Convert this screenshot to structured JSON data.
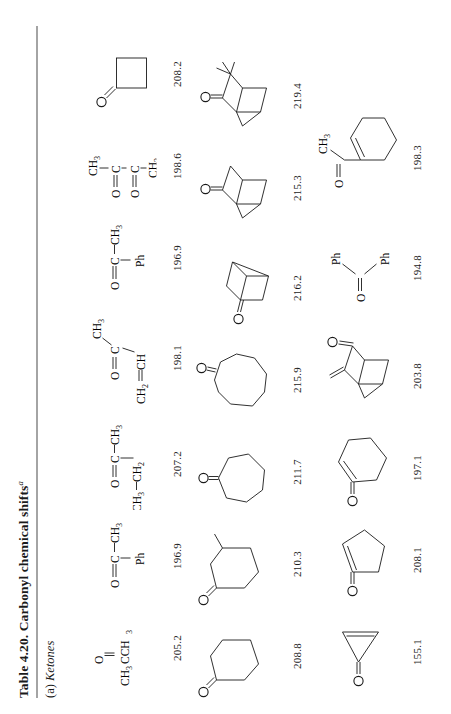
{
  "page": {
    "title_number": "Table 4.20.",
    "title_text": "Carbonyl chemical shifts",
    "title_footnote_marker": "a",
    "section_label_prefix": "(a)",
    "section_label": "Ketones",
    "rotation_note": "page content rotated 90 degrees counter-clockwise"
  },
  "table": {
    "rows": [
      {
        "row_id": "row-1",
        "entries": [
          {
            "name": "acetone",
            "formula": "CH3CCH3 (C=O)",
            "shift": "205.2"
          },
          {
            "name": "acetophenone",
            "formula": "Ph-C(=O)-CH3",
            "shift": "196.9"
          },
          {
            "name": "2-butanone",
            "formula": "CH3-CH2-C(=O)-CH3",
            "shift": "207.2"
          },
          {
            "name": "methyl-vinyl-ketone",
            "formula": "CH2=CH-C(=O)-CH3",
            "shift": "198.1"
          },
          {
            "name": "acetophenone-2",
            "formula": "Ph-C(=O)-CH3",
            "shift": "196.9"
          },
          {
            "name": "biacetyl",
            "formula": "CH3-C(=O)-C(=O)-CH3",
            "shift": "198.6"
          },
          {
            "name": "cyclobutanone",
            "formula": "cyclobutanone",
            "shift": "208.2"
          }
        ]
      },
      {
        "row_id": "row-2",
        "entries": [
          {
            "name": "cyclohexanone",
            "formula": "cyclohexanone",
            "shift": "208.8"
          },
          {
            "name": "methylcyclohexanone",
            "formula": "2-methylcyclohexanone",
            "shift": "210.3"
          },
          {
            "name": "cycloheptanone",
            "formula": "cycloheptanone",
            "shift": "211.7"
          },
          {
            "name": "cyclooctanone",
            "formula": "cyclooctanone",
            "shift": "215.9"
          },
          {
            "name": "bicyclo-2-2-2-octan-2-one",
            "formula": "bicyclo[2.2.2]octan-2-one",
            "shift": "216.2"
          },
          {
            "name": "norbornan-2-one",
            "formula": "norbornan-2-one",
            "shift": "215.3"
          },
          {
            "name": "camphor",
            "formula": "camphor",
            "shift": "219.4"
          }
        ]
      },
      {
        "row_id": "row-3",
        "entries": [
          {
            "name": "cyclopropenone",
            "formula": "cyclopropenone",
            "shift": "155.1"
          },
          {
            "name": "cyclopent-2-enone",
            "formula": "cyclopent-2-enone",
            "shift": "208.1"
          },
          {
            "name": "cyclohex-2-enone",
            "formula": "cyclohex-2-enone",
            "shift": "197.1"
          },
          {
            "name": "methylene-norbornanone",
            "formula": "3-methylenenorbornan-2-one",
            "shift": "203.8"
          },
          {
            "name": "benzophenone",
            "formula": "Ph-C(=O)-Ph",
            "shift": "194.8"
          },
          {
            "name": "1-acetylcyclohexene",
            "formula": "1-acetylcyclohexene",
            "shift": "198.3"
          }
        ]
      }
    ]
  },
  "labels": {
    "O": "O",
    "C": "C",
    "Ph": "Ph",
    "CH": "CH",
    "CH2": "CH",
    "CH3": "CH",
    "sub2": "2",
    "sub3": "3"
  },
  "colors": {
    "ink": "#1a1a1a",
    "rule": "#4a4a4a",
    "paper": "#ffffff"
  }
}
